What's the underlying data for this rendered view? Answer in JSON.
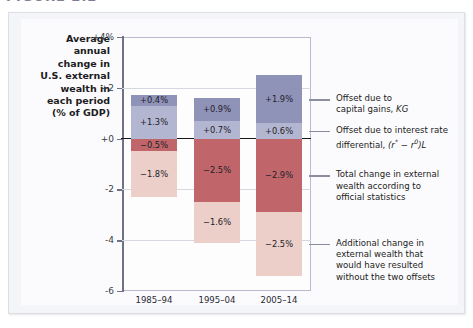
{
  "figure": {
    "caption": "FIGURE 2.2"
  },
  "chart_data": {
    "type": "bar",
    "title": "",
    "subtitle": "",
    "xlabel": "",
    "ylabel": "Average annual change in U.S. external wealth in each period (% of GDP)",
    "ylim": [
      -6,
      4
    ],
    "yticks": [
      "+4%",
      "+2",
      "+0",
      "-2",
      "-4",
      "-6"
    ],
    "ytick_values": [
      4,
      2,
      0,
      -2,
      -4,
      -6
    ],
    "grid": true,
    "legend_position": "right-annotations",
    "stacked": true,
    "categories": [
      "1985–94",
      "1995–04",
      "2005–14"
    ],
    "series": [
      {
        "name": "Offset due to capital gains, KG",
        "key": "kg",
        "color": "#9093b8",
        "values": [
          0.4,
          0.9,
          1.9
        ],
        "labels": [
          "+0.4%",
          "+0.9%",
          "+1.9%"
        ]
      },
      {
        "name": "Offset due to interest rate differential, (r* − r⁰)L",
        "key": "ir",
        "color": "#b3b6d0",
        "values": [
          1.3,
          0.7,
          0.6
        ],
        "labels": [
          "+1.3%",
          "+0.7%",
          "+0.6%"
        ]
      },
      {
        "name": "Total change in external wealth according to official statistics",
        "key": "total",
        "color": "#c0666b",
        "values": [
          -0.5,
          -2.5,
          -2.9
        ],
        "labels": [
          "−0.5%",
          "−2.5%",
          "−2.9%"
        ]
      },
      {
        "name": "Additional change in external wealth that would have resulted without the two offsets",
        "key": "add",
        "color": "#eccfc8",
        "values": [
          -1.8,
          -1.6,
          -2.5
        ],
        "labels": [
          "−1.8%",
          "−1.6%",
          "−2.5%"
        ]
      }
    ]
  },
  "ylabel_lines": [
    "Average",
    "annual",
    "change in",
    "U.S. external",
    "wealth in",
    "each period",
    "(% of GDP)"
  ],
  "annotations": [
    {
      "id": "kg",
      "lines": [
        "Offset due to",
        "capital gains, KG"
      ]
    },
    {
      "id": "ir",
      "lines": [
        "Offset due to interest rate",
        "differential, (r* − r⁰)L"
      ]
    },
    {
      "id": "total",
      "lines": [
        "Total change in external",
        "wealth according to",
        "official statistics"
      ]
    },
    {
      "id": "add",
      "lines": [
        "Additional change in",
        "external wealth that",
        "would have resulted",
        "without the two offsets"
      ]
    }
  ]
}
